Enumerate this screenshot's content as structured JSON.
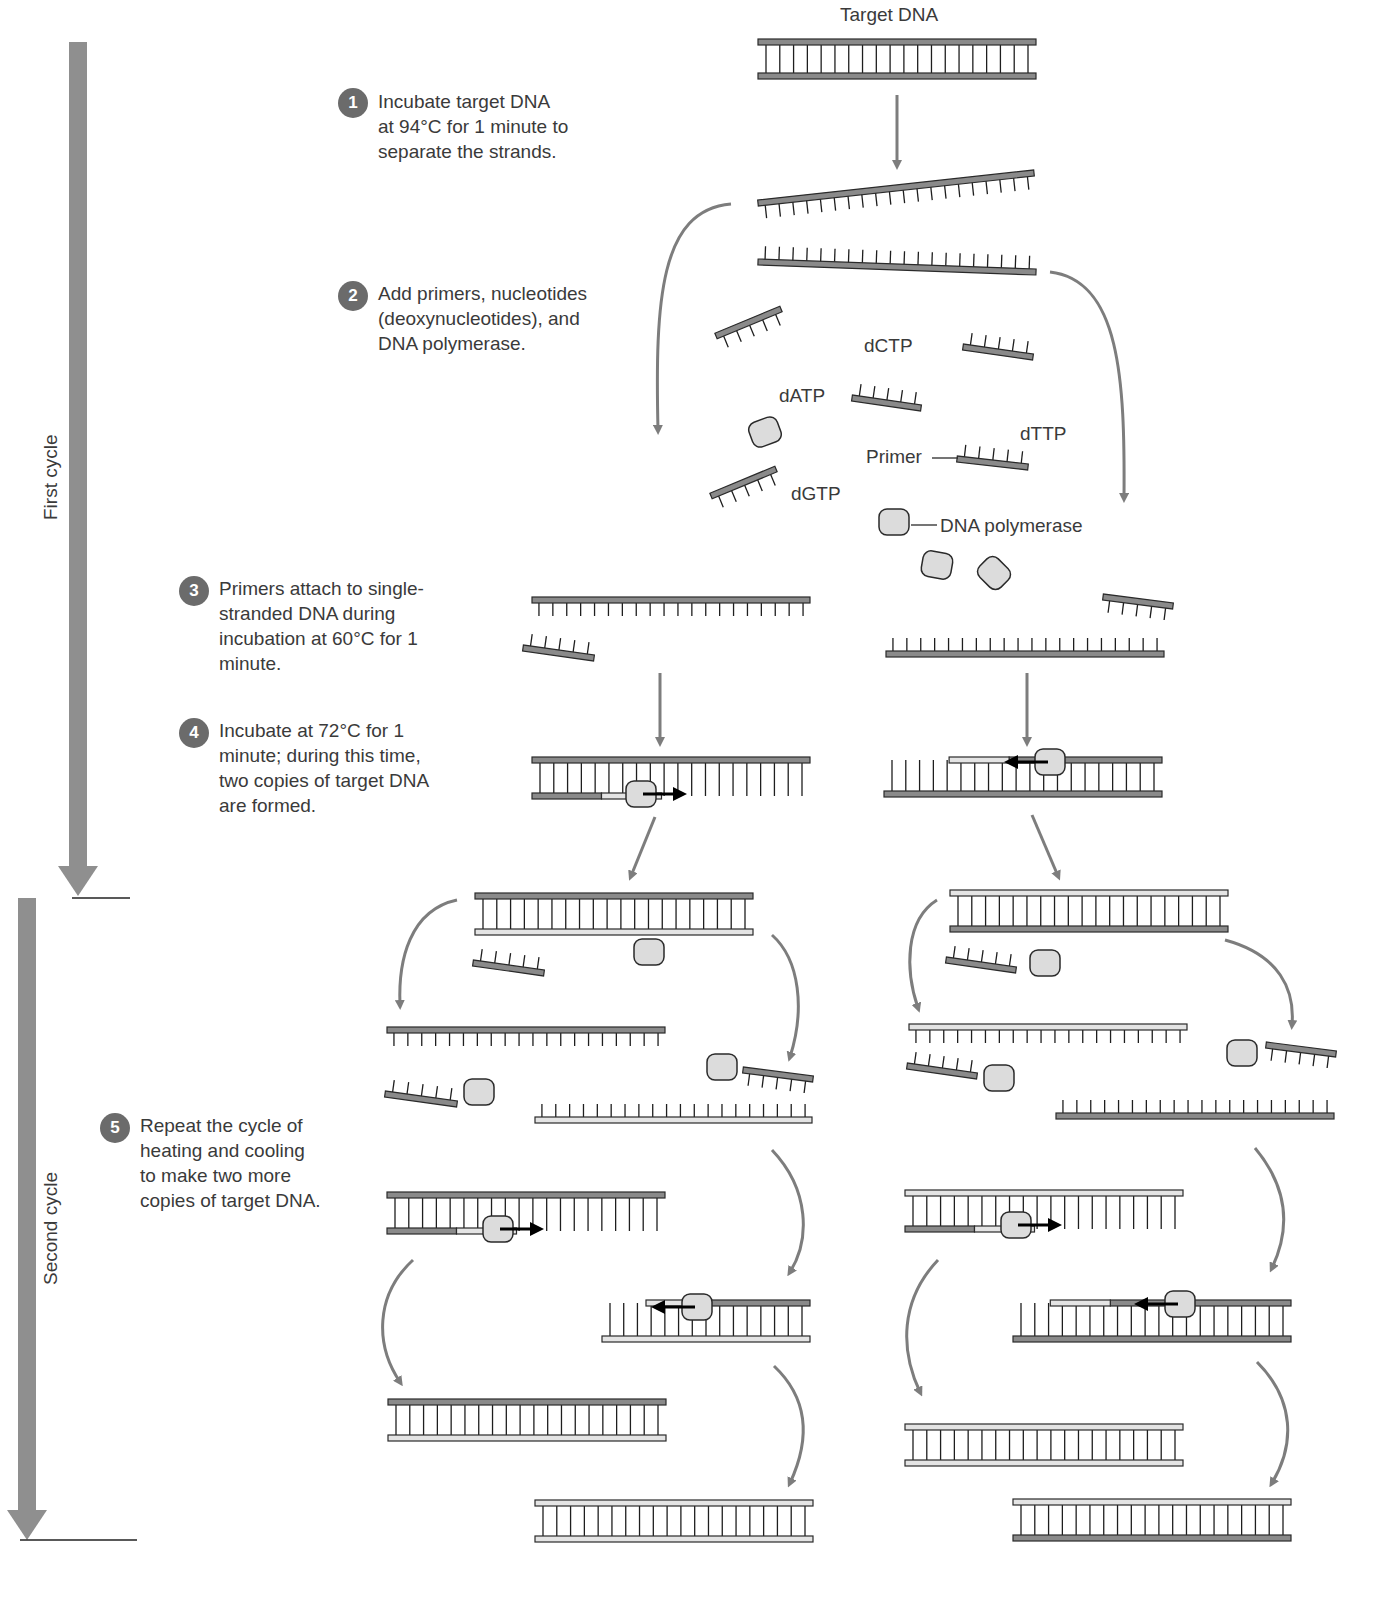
{
  "title": "Target DNA",
  "cycles": {
    "first": "First cycle",
    "second": "Second cycle"
  },
  "steps": [
    {
      "num": "1",
      "text": "Incubate target DNA\nat 94°C for 1 minute to\nseparate the strands."
    },
    {
      "num": "2",
      "text": "Add primers, nucleotides\n(deoxynucleotides), and\nDNA polymerase."
    },
    {
      "num": "3",
      "text": "Primers attach to single-\nstranded DNA during\nincubation at 60°C for 1\nminute."
    },
    {
      "num": "4",
      "text": "Incubate at 72°C for 1\nminute; during this time,\ntwo copies of target DNA\nare formed."
    },
    {
      "num": "5",
      "text": "Repeat the cycle of\nheating and cooling\nto make two more\ncopies of target DNA."
    }
  ],
  "labels": {
    "dctp": "dCTP",
    "datp": "dATP",
    "dttp": "dTTP",
    "dgtp": "dGTP",
    "primer": "Primer",
    "polymerase": "DNA polymerase"
  },
  "colors": {
    "original_strand": "#8a8a8a",
    "new_strand": "#e4e4e4",
    "outline": "#2a2a2a",
    "arrow": "#7d7d7d",
    "polymerase_fill": "#dcdcdc",
    "step_badge": "#6b6b6b",
    "cycle_bar": "#8f8f8f"
  },
  "diagram": {
    "ladders": [
      {
        "id": "target-dna",
        "x": 758,
        "y": 42,
        "w": 278,
        "h": 34,
        "top": "dark",
        "bot": "dark",
        "rungs": 20
      },
      {
        "id": "c1-left-product",
        "x": 532,
        "y": 760,
        "w": 278,
        "h": 36,
        "top": "dark",
        "bot": "mixed",
        "rungs": 20,
        "partial": 0.5
      },
      {
        "id": "c1-right-product",
        "x": 884,
        "y": 760,
        "w": 278,
        "h": 34,
        "top": "mixed-r",
        "bot": "dark",
        "rungs": 20,
        "partialR": 0.45
      },
      {
        "id": "c2-left-top",
        "x": 475,
        "y": 896,
        "w": 278,
        "h": 36,
        "top": "dark",
        "bot": "light",
        "rungs": 20
      },
      {
        "id": "c2-right-top",
        "x": 950,
        "y": 893,
        "w": 278,
        "h": 36,
        "top": "light",
        "bot": "dark",
        "rungs": 20
      },
      {
        "id": "c2-ll-ext",
        "x": 387,
        "y": 1195,
        "w": 278,
        "h": 36,
        "top": "dark",
        "bot": "mixed",
        "rungs": 20,
        "partial": 0.5
      },
      {
        "id": "c2-lr-ext",
        "x": 602,
        "y": 1303,
        "w": 208,
        "h": 36,
        "top": "mixed-r",
        "bot": "light",
        "rungs": 15,
        "partialR": 0.5
      },
      {
        "id": "c2-rl-ext",
        "x": 905,
        "y": 1193,
        "w": 278,
        "h": 36,
        "top": "light",
        "bot": "mixed",
        "rungs": 20,
        "partial": 0.5
      },
      {
        "id": "c2-rr-ext",
        "x": 1013,
        "y": 1303,
        "w": 278,
        "h": 36,
        "top": "mixed-r",
        "bot": "dark",
        "rungs": 20,
        "partialR": 0.35
      },
      {
        "id": "final-1",
        "x": 388,
        "y": 1402,
        "w": 278,
        "h": 36,
        "top": "dark",
        "bot": "light",
        "rungs": 20
      },
      {
        "id": "final-2",
        "x": 535,
        "y": 1503,
        "w": 278,
        "h": 36,
        "top": "light",
        "bot": "light",
        "rungs": 20
      },
      {
        "id": "final-3",
        "x": 905,
        "y": 1427,
        "w": 278,
        "h": 36,
        "top": "light",
        "bot": "light",
        "rungs": 20
      },
      {
        "id": "final-4",
        "x": 1013,
        "y": 1502,
        "w": 278,
        "h": 36,
        "top": "light",
        "bot": "dark",
        "rungs": 20
      }
    ],
    "strands": [
      {
        "id": "sep-top",
        "x1": 758,
        "y1": 203,
        "x2": 1034,
        "y2": 173,
        "side": "down",
        "color": "dark",
        "rungs": 20
      },
      {
        "id": "sep-bot",
        "x1": 758,
        "y1": 262,
        "x2": 1036,
        "y2": 272,
        "side": "up",
        "color": "dark",
        "rungs": 20
      },
      {
        "id": "c1-left-template",
        "x1": 532,
        "y1": 600,
        "x2": 810,
        "y2": 600,
        "side": "down",
        "color": "dark",
        "rungs": 20
      },
      {
        "id": "c1-right-template",
        "x1": 886,
        "y1": 654,
        "x2": 1164,
        "y2": 654,
        "side": "up",
        "color": "dark",
        "rungs": 20
      },
      {
        "id": "c2-ll-template",
        "x1": 387,
        "y1": 1030,
        "x2": 665,
        "y2": 1030,
        "side": "down",
        "color": "dark",
        "rungs": 20
      },
      {
        "id": "c2-lr-template",
        "x1": 535,
        "y1": 1120,
        "x2": 812,
        "y2": 1120,
        "side": "up",
        "color": "light",
        "rungs": 20
      },
      {
        "id": "c2-rl-template",
        "x1": 909,
        "y1": 1027,
        "x2": 1187,
        "y2": 1027,
        "side": "down",
        "color": "light",
        "rungs": 20
      },
      {
        "id": "c2-rr-template",
        "x1": 1056,
        "y1": 1116,
        "x2": 1334,
        "y2": 1116,
        "side": "up",
        "color": "dark",
        "rungs": 20
      }
    ],
    "primers": [
      {
        "x1": 716,
        "y1": 336,
        "x2": 781,
        "y2": 309,
        "side": "down"
      },
      {
        "x1": 963,
        "y1": 347,
        "x2": 1033,
        "y2": 357,
        "side": "up"
      },
      {
        "x1": 852,
        "y1": 398,
        "x2": 921,
        "y2": 408,
        "side": "up"
      },
      {
        "x1": 957,
        "y1": 459,
        "x2": 1028,
        "y2": 467,
        "side": "up"
      },
      {
        "x1": 711,
        "y1": 496,
        "x2": 776,
        "y2": 469,
        "side": "down"
      },
      {
        "x1": 523,
        "y1": 648,
        "x2": 594,
        "y2": 658,
        "side": "up"
      },
      {
        "x1": 1103,
        "y1": 597,
        "x2": 1173,
        "y2": 606,
        "side": "down"
      },
      {
        "x1": 473,
        "y1": 963,
        "x2": 544,
        "y2": 973,
        "side": "up"
      },
      {
        "x1": 385,
        "y1": 1094,
        "x2": 457,
        "y2": 1104,
        "side": "up"
      },
      {
        "x1": 743,
        "y1": 1070,
        "x2": 813,
        "y2": 1079,
        "side": "down"
      },
      {
        "x1": 946,
        "y1": 960,
        "x2": 1016,
        "y2": 970,
        "side": "up"
      },
      {
        "x1": 907,
        "y1": 1066,
        "x2": 977,
        "y2": 1076,
        "side": "up"
      },
      {
        "x1": 1266,
        "y1": 1045,
        "x2": 1336,
        "y2": 1054,
        "side": "down"
      }
    ],
    "polymerases": [
      {
        "x": 765,
        "y": 432,
        "r": -20
      },
      {
        "x": 894,
        "y": 522,
        "r": 0
      },
      {
        "x": 937,
        "y": 565,
        "r": 10
      },
      {
        "x": 994,
        "y": 573,
        "r": 45
      },
      {
        "x": 649,
        "y": 952,
        "r": 0
      },
      {
        "x": 479,
        "y": 1092,
        "r": 0
      },
      {
        "x": 722,
        "y": 1067,
        "r": 0
      },
      {
        "x": 1045,
        "y": 963,
        "r": 0
      },
      {
        "x": 999,
        "y": 1078,
        "r": 0
      },
      {
        "x": 1242,
        "y": 1053,
        "r": 0
      }
    ],
    "active_polymerases": [
      {
        "x": 641,
        "y": 794,
        "dir": "right"
      },
      {
        "x": 1050,
        "y": 762,
        "dir": "left"
      },
      {
        "x": 498,
        "y": 1229,
        "dir": "right"
      },
      {
        "x": 697,
        "y": 1307,
        "dir": "left"
      },
      {
        "x": 1016,
        "y": 1225,
        "dir": "right"
      },
      {
        "x": 1180,
        "y": 1304,
        "dir": "left"
      }
    ],
    "straight_arrows": [
      {
        "x1": 897,
        "y1": 95,
        "x2": 897,
        "y2": 165
      },
      {
        "x1": 660,
        "y1": 673,
        "x2": 660,
        "y2": 742
      },
      {
        "x1": 1027,
        "y1": 673,
        "x2": 1027,
        "y2": 742
      },
      {
        "x1": 655,
        "y1": 817,
        "x2": 631,
        "y2": 876
      },
      {
        "x1": 1032,
        "y1": 815,
        "x2": 1058,
        "y2": 876
      }
    ],
    "curved_arrows": [
      {
        "d": "M731,204 C660,210 655,300 658,430"
      },
      {
        "d": "M1050,272 C1120,280 1125,380 1124,498"
      },
      {
        "d": "M457,900 C410,910 398,960 400,1005"
      },
      {
        "d": "M772,935 C800,960 805,1010 790,1057"
      },
      {
        "d": "M937,900 C905,920 905,970 918,1008"
      },
      {
        "d": "M1225,940 C1280,955 1295,990 1292,1025"
      },
      {
        "d": "M772,1150 C810,1190 810,1240 790,1272"
      },
      {
        "d": "M1255,1148 C1290,1190 1290,1230 1272,1268"
      },
      {
        "d": "M413,1260 C375,1295 375,1345 400,1382"
      },
      {
        "d": "M938,1260 C900,1300 900,1350 920,1392"
      },
      {
        "d": "M774,1366 C810,1400 810,1440 790,1483"
      },
      {
        "d": "M1257,1362 C1295,1400 1295,1445 1272,1483"
      }
    ],
    "cycle_bars": [
      {
        "id": "first",
        "x": 78,
        "y1": 42,
        "y2": 896,
        "rule_y": 898,
        "rule_x1": 72,
        "rule_x2": 130
      },
      {
        "id": "second",
        "x": 27,
        "y1": 898,
        "y2": 1540,
        "rule_y": 1540,
        "rule_x1": 20,
        "rule_x2": 137
      }
    ]
  }
}
